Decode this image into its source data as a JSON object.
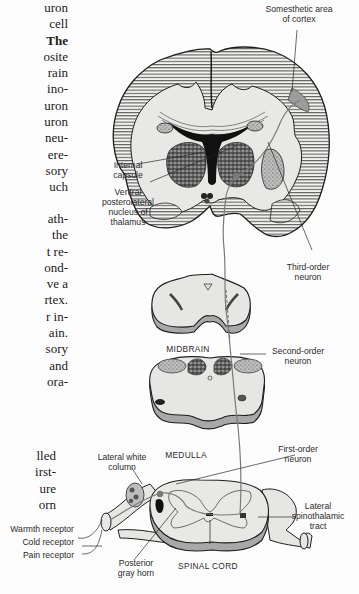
{
  "body_text": {
    "block1": [
      "uron",
      "cell",
      "The",
      "osite",
      "rain",
      "ino-",
      "uron",
      "uron",
      "neu-",
      "ere-",
      "sory",
      "uch"
    ],
    "block2": [
      "ath-",
      "the",
      "t re-",
      "ond-",
      "ve a",
      "rtex.",
      "r in-",
      "ain.",
      "sory",
      "and",
      "ora-"
    ],
    "block3": [
      "lled",
      "irst-",
      "ure",
      "orn"
    ]
  },
  "diagram": {
    "labels": {
      "somesthetic_area": [
        "Somesthetic area",
        "of cortex"
      ],
      "internal_capsule": [
        "Internal",
        "capsule"
      ],
      "vpl_nucleus": [
        "Ventral",
        "posterolateral",
        "nucleus of",
        "thalamus"
      ],
      "third_order": [
        "Third-order",
        "neuron"
      ],
      "midbrain": "MIDBRAIN",
      "second_order": [
        "Second-order",
        "neuron"
      ],
      "medulla": "MEDULLA",
      "first_order": [
        "First-order",
        "neuron"
      ],
      "lateral_white_column": [
        "Lateral white",
        "column"
      ],
      "lateral_spinothalamic": [
        "Lateral",
        "spinothalamic",
        "tract"
      ],
      "warmth_receptor": "Warmth receptor",
      "cold_receptor": "Cold receptor",
      "pain_receptor": "Pain receptor",
      "posterior_gray_horn": [
        "Posterior",
        "gray horn"
      ],
      "spinal_cord": "SPINAL CORD"
    },
    "colors": {
      "tissue_fill": "#e6e6e4",
      "outline": "#1e1e1e",
      "hatch": "#333333",
      "pathway": "#7a7a7a",
      "section_edge": "#9a9a9a"
    }
  }
}
